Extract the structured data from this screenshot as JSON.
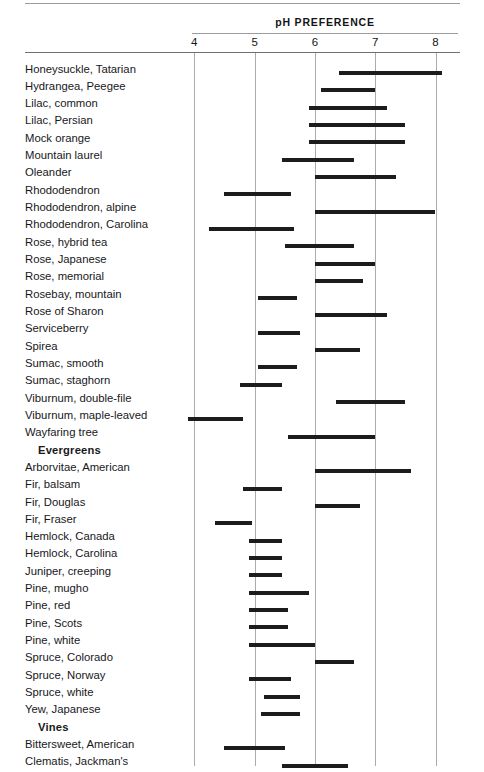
{
  "header": {
    "title": "pH PREFERENCE"
  },
  "axis": {
    "ticks": [
      "4",
      "5",
      "6",
      "7",
      "8"
    ],
    "min": 4,
    "max": 8
  },
  "chart_data": {
    "type": "bar",
    "orientation": "horizontal-range",
    "title": "pH PREFERENCE",
    "xlabel": "pH",
    "ylabel": "",
    "xlim": [
      3.9,
      8.1
    ],
    "xticks": [
      4,
      5,
      6,
      7,
      8
    ],
    "grid": "vertical",
    "legend": "none",
    "value_unit": "pH range (low, high)",
    "rows": [
      {
        "label": "Honeysuckle, Tatarian",
        "type": "item",
        "low": 6.4,
        "high": 8.1
      },
      {
        "label": "Hydrangea, Peegee",
        "type": "item",
        "low": 6.1,
        "high": 7.0
      },
      {
        "label": "Lilac, common",
        "type": "item",
        "low": 5.9,
        "high": 7.2
      },
      {
        "label": "Lilac, Persian",
        "type": "item",
        "low": 5.9,
        "high": 7.5
      },
      {
        "label": "Mock orange",
        "type": "item",
        "low": 5.9,
        "high": 7.5
      },
      {
        "label": "Mountain laurel",
        "type": "item",
        "low": 5.45,
        "high": 6.65
      },
      {
        "label": "Oleander",
        "type": "item",
        "low": 6.0,
        "high": 7.35
      },
      {
        "label": "Rhododendron",
        "type": "item",
        "low": 4.5,
        "high": 5.6
      },
      {
        "label": "Rhododendron, alpine",
        "type": "item",
        "low": 6.0,
        "high": 8.0
      },
      {
        "label": "Rhododendron, Carolina",
        "type": "item",
        "low": 4.25,
        "high": 5.65
      },
      {
        "label": "Rose, hybrid tea",
        "type": "item",
        "low": 5.5,
        "high": 6.65
      },
      {
        "label": "Rose, Japanese",
        "type": "item",
        "low": 6.0,
        "high": 7.0
      },
      {
        "label": "Rose, memorial",
        "type": "item",
        "low": 6.0,
        "high": 6.8
      },
      {
        "label": "Rosebay, mountain",
        "type": "item",
        "low": 5.05,
        "high": 5.7
      },
      {
        "label": "Rose of Sharon",
        "type": "item",
        "low": 6.0,
        "high": 7.2
      },
      {
        "label": "Serviceberry",
        "type": "item",
        "low": 5.05,
        "high": 5.75
      },
      {
        "label": "Spirea",
        "type": "item",
        "low": 6.0,
        "high": 6.75
      },
      {
        "label": "Sumac, smooth",
        "type": "item",
        "low": 5.05,
        "high": 5.7
      },
      {
        "label": "Sumac, staghorn",
        "type": "item",
        "low": 4.75,
        "high": 5.45
      },
      {
        "label": "Viburnum, double-file",
        "type": "item",
        "low": 6.35,
        "high": 7.5
      },
      {
        "label": "Viburnum, maple-leaved",
        "type": "item",
        "low": 3.9,
        "high": 4.8
      },
      {
        "label": "Wayfaring tree",
        "type": "item",
        "low": 5.55,
        "high": 7.0
      },
      {
        "label": "Evergreens",
        "type": "section"
      },
      {
        "label": "Arborvitae, American",
        "type": "item",
        "low": 6.0,
        "high": 7.6
      },
      {
        "label": "Fir, balsam",
        "type": "item",
        "low": 4.8,
        "high": 5.45
      },
      {
        "label": "Fir, Douglas",
        "type": "item",
        "low": 6.0,
        "high": 6.75
      },
      {
        "label": "Fir, Fraser",
        "type": "item",
        "low": 4.35,
        "high": 4.95
      },
      {
        "label": "Hemlock, Canada",
        "type": "item",
        "low": 4.9,
        "high": 5.45
      },
      {
        "label": "Hemlock, Carolina",
        "type": "item",
        "low": 4.9,
        "high": 5.45
      },
      {
        "label": "Juniper, creeping",
        "type": "item",
        "low": 4.9,
        "high": 5.45
      },
      {
        "label": "Pine, mugho",
        "type": "item",
        "low": 4.9,
        "high": 5.9
      },
      {
        "label": "Pine, red",
        "type": "item",
        "low": 4.9,
        "high": 5.55
      },
      {
        "label": "Pine, Scots",
        "type": "item",
        "low": 4.9,
        "high": 5.55
      },
      {
        "label": "Pine, white",
        "type": "item",
        "low": 4.9,
        "high": 6.0
      },
      {
        "label": "Spruce, Colorado",
        "type": "item",
        "low": 6.0,
        "high": 6.65
      },
      {
        "label": "Spruce, Norway",
        "type": "item",
        "low": 4.9,
        "high": 5.6
      },
      {
        "label": "Spruce, white",
        "type": "item",
        "low": 5.15,
        "high": 5.75
      },
      {
        "label": "Yew, Japanese",
        "type": "item",
        "low": 5.1,
        "high": 5.75
      },
      {
        "label": "Vines",
        "type": "section"
      },
      {
        "label": "Bittersweet, American",
        "type": "item",
        "low": 4.5,
        "high": 5.5
      },
      {
        "label": "Clematis, Jackman's",
        "type": "item",
        "low": 5.45,
        "high": 6.55
      }
    ]
  },
  "colors": {
    "bar": "#1b1c1e",
    "gridline": "#a9abad",
    "rule": "#8d8f91",
    "text": "#17181a",
    "background": "#ffffff"
  }
}
